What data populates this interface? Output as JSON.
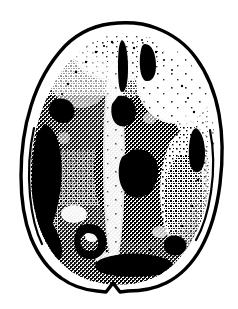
{
  "figure": {
    "name": "axial-brain-scan-illustration",
    "title": "Axial head scan line illustration",
    "modality": "CT-style axial brain section",
    "orientation": "axial",
    "style": "stippled halftone pen-and-ink line art",
    "rendering": "1-bit black and white, no grayscale",
    "canvas": {
      "width": 238,
      "height": 309
    },
    "colors": {
      "background": "#ffffff",
      "ink": "#000000",
      "skull_outline": "#000000",
      "parenchyma_stipple": "#000000",
      "lesion_fill": "#000000"
    },
    "labels": [],
    "annotations": [],
    "scale_bar": null
  },
  "skull": {
    "name": "skull-outline",
    "description": "Hand-drawn irregular ovoid cranial contour, wider at the parietal level, tapering to a rounded frontal pole at top and an occipital base with a small midline V-notch",
    "stroke_width": 3,
    "extents": {
      "top": 22,
      "bottom": 294,
      "left": 26,
      "right": 223
    },
    "widest_y": 163,
    "notch": {
      "x": 106,
      "y": 281,
      "depth": 9,
      "name": "occipital-midline-notch"
    }
  },
  "brain": {
    "name": "brain-parenchyma",
    "description": "Dithered stipple field filling the intracranial space; density varies from sparse at the superior-right margin to saturated black along the left convexity",
    "midline": {
      "name": "interhemispheric-fissure",
      "description": "Pale vertical band running top to bottom slightly left of centre",
      "x": 113
    },
    "density_zones": [
      {
        "name": "right-frontal-sparse",
        "region": "upper right",
        "density": "light"
      },
      {
        "name": "left-convexity-dense",
        "region": "left lateral",
        "density": "solid black"
      },
      {
        "name": "central-mid-dense",
        "region": "centre",
        "density": "medium"
      },
      {
        "name": "posterior-dense",
        "region": "inferior centre",
        "density": "heavy"
      }
    ]
  },
  "features": [
    {
      "name": "left-frontal-lesion",
      "description": "Small solid black blob on the left frontal convexity",
      "cx": 62,
      "cy": 110,
      "rx": 12,
      "ry": 11
    },
    {
      "name": "left-parietal-band-lesion",
      "description": "Thick solid black crescent hugging the inner table of the left skull",
      "cx": 50,
      "cy": 180,
      "rx": 18,
      "ry": 58
    },
    {
      "name": "superior-vertical-streak-medial",
      "description": "Narrow vertical black streak left of midline near the vertex",
      "cx": 124,
      "cy": 66,
      "rx": 4,
      "ry": 26
    },
    {
      "name": "superior-vertical-streak-lateral",
      "description": "Short thick vertical black streak right of midline near the vertex",
      "cx": 149,
      "cy": 62,
      "rx": 6,
      "ry": 19
    },
    {
      "name": "right-parietal-lesion",
      "description": "Elongated solid black blob against the right inner table",
      "cx": 198,
      "cy": 148,
      "rx": 8,
      "ry": 20
    },
    {
      "name": "left-posterior-ring-lesion",
      "description": "C-shaped dark ring with a lighter centre in the left posterior region",
      "cx": 88,
      "cy": 239,
      "rx": 16,
      "ry": 14
    },
    {
      "name": "central-mass",
      "description": "Broad dark mass occupying the central and left-central brain",
      "cx": 140,
      "cy": 170,
      "rx": 42,
      "ry": 70
    },
    {
      "name": "occipital-dense-band",
      "description": "Dense black band across the inferior brain margin",
      "cx": 130,
      "cy": 262,
      "rx": 38,
      "ry": 12
    }
  ]
}
